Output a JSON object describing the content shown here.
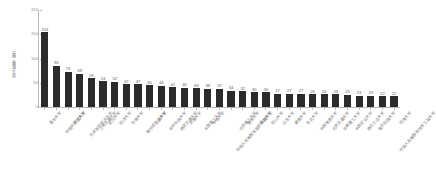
{
  "chart_data": {
    "type": "bar",
    "title": "",
    "subtitle": "",
    "xlabel": "",
    "ylabel": "论文数量（篇）",
    "ylim": [
      0,
      200
    ],
    "yticks": [
      0,
      50,
      100,
      150,
      200
    ],
    "ytick_labels": [
      "0",
      "50",
      "100",
      "150",
      "200"
    ],
    "grid": false,
    "legend": "none",
    "orientation": "vertical",
    "bar_color": "#2b2b2b",
    "value_labels_shown": true,
    "categories": [
      "清华大学",
      "中国科学院大学",
      "浙江大学",
      "北京航空航天大学",
      "上海交通大学",
      "武汉大学",
      "同济大学",
      "东南大学",
      "哈尔滨工业大学",
      "北京大学",
      "华中科技大学",
      "西安交通大学",
      "天津大学",
      "大连理工大学",
      "中南大学",
      "中国人民解放军国防科技大学",
      "北京理工大学",
      "重庆大学",
      "南京大学",
      "四川大学",
      "山东大学",
      "湖南大学",
      "东北大学",
      "中国地质大学",
      "北京交通大学",
      "华南理工大学",
      "中国矿业大学",
      "西北工业大学",
      "电子科技大学",
      "中国人民解放军陆军工程大学",
      "河海大学"
    ],
    "values": [
      154,
      85,
      73,
      69,
      59,
      53,
      52,
      47,
      47,
      45,
      44,
      41,
      40,
      39,
      38,
      37,
      34,
      32,
      30,
      30,
      27,
      27,
      27,
      26,
      26,
      26,
      25,
      23,
      23,
      22,
      22
    ]
  }
}
